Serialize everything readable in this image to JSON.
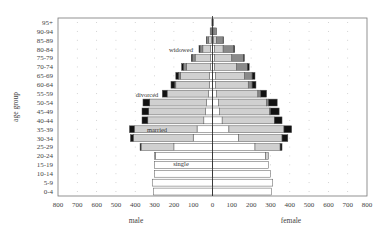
{
  "chart_data": {
    "type": "bar",
    "subtype": "population-pyramid-stacked",
    "title": "",
    "ylabel": "age group",
    "xlabel_left": "male",
    "xlabel_right": "female",
    "xlim": [
      -800,
      800
    ],
    "x_ticks": [
      "800",
      "700",
      "600",
      "500",
      "400",
      "300",
      "200",
      "100",
      "0",
      "100",
      "200",
      "300",
      "400",
      "500",
      "600",
      "700",
      "800"
    ],
    "grid": "dotted",
    "categories": [
      "0-4",
      "5-9",
      "10-14",
      "15-19",
      "20-24",
      "25-29",
      "30-34",
      "35-39",
      "40-44",
      "45-49",
      "50-54",
      "55-59",
      "60-64",
      "65-69",
      "70-74",
      "75-79",
      "80-84",
      "85-89",
      "90-94",
      "95+"
    ],
    "stack_order": [
      "single",
      "married",
      "widowed",
      "divorced"
    ],
    "colors": {
      "single": "#ffffff",
      "married": "#d0d0d0",
      "widowed": "#8a8a8a",
      "divorced": "#111111",
      "edge": "#555555"
    },
    "annotations": [
      {
        "text": "single",
        "side": "male",
        "category": "15-19"
      },
      {
        "text": "married",
        "side": "male",
        "category": "35-39"
      },
      {
        "text": "divorced",
        "side": "male",
        "category": "55-59"
      },
      {
        "text": "widowed",
        "side": "male",
        "category": "80-84"
      }
    ],
    "series": {
      "male": {
        "single": [
          305,
          312,
          300,
          300,
          295,
          200,
          100,
          80,
          45,
          35,
          30,
          20,
          15,
          15,
          10,
          10,
          10,
          5,
          2,
          1
        ],
        "married": [
          0,
          0,
          0,
          0,
          5,
          170,
          310,
          325,
          290,
          295,
          295,
          215,
          175,
          150,
          125,
          80,
          40,
          15,
          5,
          1
        ],
        "widowed": [
          0,
          0,
          0,
          0,
          0,
          0,
          0,
          0,
          0,
          0,
          0,
          0,
          5,
          10,
          15,
          15,
          15,
          10,
          5,
          1
        ],
        "divorced": [
          0,
          0,
          0,
          0,
          0,
          5,
          15,
          25,
          30,
          35,
          35,
          25,
          20,
          15,
          10,
          5,
          5,
          2,
          0,
          0
        ]
      },
      "female": {
        "single": [
          305,
          312,
          300,
          290,
          275,
          220,
          135,
          85,
          50,
          35,
          30,
          20,
          15,
          15,
          10,
          10,
          10,
          5,
          2,
          1
        ],
        "married": [
          0,
          0,
          0,
          0,
          15,
          130,
          225,
          285,
          270,
          260,
          250,
          215,
          170,
          150,
          115,
          90,
          45,
          15,
          5,
          1
        ],
        "widowed": [
          0,
          0,
          0,
          0,
          0,
          0,
          0,
          0,
          0,
          5,
          10,
          15,
          20,
          40,
          55,
          60,
          55,
          35,
          15,
          2
        ],
        "divorced": [
          0,
          0,
          0,
          0,
          0,
          10,
          30,
          40,
          40,
          45,
          45,
          30,
          20,
          15,
          10,
          5,
          5,
          2,
          0,
          0
        ]
      }
    }
  },
  "labels": {
    "ylabel": "age group",
    "male": "male",
    "female": "female"
  }
}
